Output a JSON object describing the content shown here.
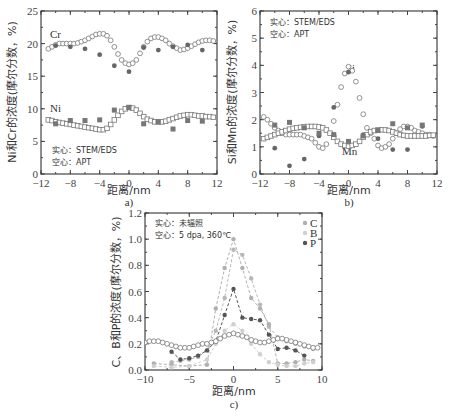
{
  "chart_data": [
    {
      "id": "a",
      "type": "scatter",
      "caption": "a)",
      "xlabel": "距离/nm",
      "ylabel": "Ni和Cr的浓度(摩尔分数，%)",
      "xlim": [
        -12,
        12
      ],
      "ylim": [
        0,
        25
      ],
      "xticks": [
        -12,
        -8,
        -4,
        0,
        4,
        8,
        12
      ],
      "yticks": [
        0,
        5,
        10,
        15,
        20,
        25
      ],
      "annotations": [
        "实心：STEM/EDS",
        "空心：APT"
      ],
      "series_labels": [
        "Cr",
        "Ni"
      ],
      "series": [
        {
          "name": "Cr APT (hollow circle)",
          "marker": "open-circle",
          "x": [
            -11,
            -10.5,
            -10,
            -9.5,
            -9,
            -8.5,
            -8,
            -7.5,
            -7,
            -6.5,
            -6,
            -5.5,
            -5,
            -4.5,
            -4,
            -3.5,
            -3,
            -2.5,
            -2,
            -1.5,
            -1,
            -0.5,
            0,
            0.5,
            1,
            1.5,
            2,
            2.5,
            3,
            3.5,
            4,
            4.5,
            5,
            5.5,
            6,
            6.5,
            7,
            7.5,
            8,
            8.5,
            9,
            9.5,
            10,
            10.5,
            11,
            11.5
          ],
          "y": [
            19.2,
            19.5,
            19.8,
            20.0,
            20.0,
            20.0,
            20.0,
            20.0,
            20.1,
            20.3,
            20.5,
            20.8,
            21.1,
            21.4,
            21.5,
            21.5,
            21.2,
            20.5,
            19.5,
            18.4,
            17.5,
            17.0,
            16.8,
            17.0,
            17.5,
            18.5,
            19.5,
            20.3,
            20.8,
            21.0,
            21.0,
            20.8,
            20.5,
            20.0,
            19.6,
            19.3,
            19.0,
            19.1,
            19.3,
            19.6,
            19.9,
            20.2,
            20.4,
            20.5,
            20.5,
            20.4
          ]
        },
        {
          "name": "Cr STEM/EDS (solid circle)",
          "marker": "filled-circle",
          "x": [
            -10,
            -8,
            -6,
            -4,
            -2,
            0,
            2,
            4,
            6,
            8,
            10
          ],
          "y": [
            19.7,
            19.5,
            19.2,
            18.3,
            16.6,
            15.7,
            19.4,
            19.0,
            19.5,
            19.8,
            19.0
          ]
        },
        {
          "name": "Ni APT (hollow square)",
          "marker": "open-square",
          "x": [
            -11,
            -10.5,
            -10,
            -9.5,
            -9,
            -8.5,
            -8,
            -7.5,
            -7,
            -6.5,
            -6,
            -5.5,
            -5,
            -4.5,
            -4,
            -3.5,
            -3,
            -2.5,
            -2,
            -1.5,
            -1,
            -0.5,
            0,
            0.5,
            1,
            1.5,
            2,
            2.5,
            3,
            3.5,
            4,
            4.5,
            5,
            5.5,
            6,
            6.5,
            7,
            7.5,
            8,
            8.5,
            9,
            9.5,
            10,
            10.5,
            11,
            11.5
          ],
          "y": [
            8.3,
            8.2,
            8.0,
            7.9,
            7.8,
            7.7,
            7.6,
            7.5,
            7.4,
            7.3,
            7.2,
            7.1,
            7.0,
            6.9,
            6.8,
            6.8,
            7.0,
            7.6,
            8.3,
            9.0,
            9.6,
            10.0,
            10.2,
            10.1,
            9.8,
            9.3,
            8.8,
            8.4,
            8.2,
            8.0,
            8.0,
            8.0,
            8.1,
            8.3,
            8.5,
            8.7,
            8.9,
            9.0,
            9.1,
            9.1,
            9.0,
            8.9,
            8.9,
            8.8,
            8.8,
            8.7
          ]
        },
        {
          "name": "Ni STEM/EDS (solid square)",
          "marker": "filled-square",
          "x": [
            -10,
            -8,
            -6,
            -4,
            -2,
            0,
            2,
            4,
            6,
            8,
            10
          ],
          "y": [
            7.7,
            8.2,
            8.2,
            8.3,
            9.8,
            10.2,
            7.7,
            8.0,
            6.9,
            8.2,
            8.1
          ]
        }
      ]
    },
    {
      "id": "b",
      "type": "scatter",
      "caption": "b)",
      "xlabel": "距离/nm",
      "ylabel": "Si和Mn的浓度(摩尔分数，%)",
      "xlim": [
        -12,
        12
      ],
      "ylim": [
        0,
        6
      ],
      "xticks": [
        -12,
        -8,
        -4,
        0,
        4,
        8,
        12
      ],
      "yticks": [
        0,
        1,
        2,
        3,
        4,
        5,
        6
      ],
      "annotations": [
        "实心：STEM/EDS",
        "空心：APT"
      ],
      "series_labels": [
        "Si",
        "Mn"
      ],
      "series": [
        {
          "name": "Si APT (hollow circle)",
          "marker": "open-circle",
          "x": [
            -11.5,
            -11,
            -10.5,
            -10,
            -9.5,
            -9,
            -8.5,
            -8,
            -7.5,
            -7,
            -6.5,
            -6,
            -5.5,
            -5,
            -4.5,
            -4,
            -3.5,
            -3,
            -2,
            -1.5,
            -1,
            -0.5,
            0,
            0.5,
            1,
            1.5,
            2,
            2.5,
            3,
            3.5,
            4,
            4.5,
            5,
            5.5,
            6,
            6.5,
            7,
            7.5,
            8,
            8.5,
            9,
            9.5,
            10,
            10.5,
            11,
            11.5
          ],
          "y": [
            2.1,
            2.0,
            1.85,
            1.7,
            1.6,
            1.5,
            1.45,
            1.45,
            1.45,
            1.45,
            1.45,
            1.4,
            1.35,
            1.3,
            1.15,
            1.0,
            0.95,
            1.1,
            1.95,
            2.55,
            3.2,
            3.7,
            3.95,
            3.8,
            3.4,
            2.8,
            2.2,
            1.7,
            1.5,
            1.3,
            1.05,
            0.95,
            1.0,
            1.1,
            1.3,
            1.5,
            1.65,
            1.75,
            1.75,
            1.7,
            1.6,
            1.55,
            1.5,
            1.45,
            1.45,
            1.4
          ]
        },
        {
          "name": "Si STEM/EDS (solid circle)",
          "marker": "filled-circle",
          "x": [
            -10,
            -8,
            -6,
            -4,
            -2,
            0,
            2,
            4,
            6,
            8,
            10
          ],
          "y": [
            0.95,
            0.3,
            0.55,
            1.4,
            2.45,
            3.75,
            1.45,
            1.3,
            0.9,
            0.9,
            1.75
          ]
        },
        {
          "name": "Mn APT (hollow square)",
          "marker": "open-square",
          "x": [
            -11.5,
            -11,
            -10.5,
            -10,
            -9.5,
            -9,
            -8.5,
            -8,
            -7.5,
            -7,
            -6.5,
            -6,
            -5.5,
            -5,
            -4.5,
            -4,
            -3.5,
            -3,
            -2.5,
            -2,
            -1.5,
            -1,
            -0.5,
            0,
            0.5,
            1,
            1.5,
            2,
            2.5,
            3,
            3.5,
            4,
            4.5,
            5,
            5.5,
            6,
            6.5,
            7,
            7.5,
            8,
            8.5,
            9,
            9.5,
            10,
            10.5,
            11,
            11.5
          ],
          "y": [
            1.3,
            1.35,
            1.4,
            1.45,
            1.5,
            1.55,
            1.6,
            1.65,
            1.68,
            1.7,
            1.72,
            1.74,
            1.75,
            1.75,
            1.75,
            1.73,
            1.7,
            1.62,
            1.5,
            1.35,
            1.2,
            1.1,
            1.05,
            1.02,
            1.05,
            1.1,
            1.2,
            1.35,
            1.45,
            1.55,
            1.6,
            1.62,
            1.63,
            1.62,
            1.6,
            1.55,
            1.5,
            1.45,
            1.42,
            1.4,
            1.4,
            1.4,
            1.4,
            1.4,
            1.4,
            1.42,
            1.43
          ]
        },
        {
          "name": "Mn STEM/EDS (solid square)",
          "marker": "filled-square",
          "x": [
            -10,
            -8,
            -6,
            -4,
            -2,
            0,
            2,
            4,
            6,
            8,
            10
          ],
          "y": [
            1.8,
            1.9,
            1.7,
            1.5,
            1.45,
            1.2,
            1.4,
            1.6,
            1.85,
            1.7,
            1.8
          ]
        }
      ]
    },
    {
      "id": "c",
      "type": "line",
      "caption": "c)",
      "xlabel": "距离/nm",
      "ylabel": "C、B和P的浓度(摩尔分数，%)",
      "xlim": [
        -10,
        10
      ],
      "ylim": [
        0,
        1.2
      ],
      "xticks": [
        -10,
        -5,
        0,
        5,
        10
      ],
      "yticks": [
        0.0,
        0.2,
        0.4,
        0.6,
        0.8,
        1.0,
        1.2
      ],
      "annotations": [
        "实心：未辐照",
        "空心：5 dpa, 360℃"
      ],
      "legend": [
        "C",
        "B",
        "P"
      ],
      "series": [
        {
          "name": "C irradiated (dashed, light gray)",
          "color": "#b8b8b8",
          "x": [
            -7,
            -6,
            -5,
            -4,
            -3,
            -2,
            -1,
            0,
            1,
            2,
            3,
            4,
            5,
            6,
            7,
            8,
            9
          ],
          "y": [
            0.06,
            0.07,
            0.08,
            0.1,
            0.15,
            0.3,
            0.55,
            0.92,
            0.88,
            0.7,
            0.5,
            0.33,
            0.25,
            0.22,
            0.2,
            0.18,
            0.16
          ]
        },
        {
          "name": "C unirradiated (filled)",
          "color": "#b0b0b0",
          "x": [
            -9,
            -7,
            -5,
            -3,
            -2,
            -1,
            0,
            1,
            2,
            3,
            4,
            5,
            6,
            7,
            8,
            9
          ],
          "y": [
            0.05,
            0.04,
            0.03,
            0.04,
            0.47,
            0.78,
            1.0,
            0.78,
            0.55,
            0.47,
            0.35,
            0.05,
            0.05,
            0.06,
            0.08,
            0.07
          ]
        },
        {
          "name": "B irradiated (dashed, lighter gray)",
          "color": "#d0d0d0",
          "x": [
            -9,
            -7,
            -5,
            -3,
            -2,
            -1,
            0,
            1,
            2,
            3,
            4,
            5,
            6,
            7,
            8,
            9
          ],
          "y": [
            0.03,
            0.02,
            0.03,
            0.08,
            0.2,
            0.3,
            0.35,
            0.3,
            0.2,
            0.12,
            0.06,
            0.04,
            0.03,
            0.03,
            0.05,
            0.06
          ]
        },
        {
          "name": "P unirradiated (dashed, dark)",
          "color": "#555555",
          "x": [
            -7,
            -6,
            -5,
            -4,
            -3,
            -2,
            -1,
            0,
            1,
            2,
            3,
            4,
            5,
            6,
            7,
            8
          ],
          "y": [
            0.14,
            0.08,
            0.09,
            0.11,
            0.15,
            0.22,
            0.42,
            0.62,
            0.4,
            0.39,
            0.38,
            0.27,
            0.16,
            0.17,
            0.15,
            0.11
          ]
        },
        {
          "name": "P irradiated APT (hollow circle)",
          "color": "#555555",
          "marker": "open-circle",
          "x": [
            -10,
            -9.5,
            -9,
            -8.5,
            -8,
            -7.5,
            -7,
            -6.5,
            -6,
            -5.5,
            -5,
            -4.5,
            -4,
            -3.5,
            -3,
            -2.5,
            -2,
            -1.5,
            -1,
            -0.5,
            0,
            0.5,
            1,
            1.5,
            2,
            2.5,
            3,
            3.5,
            4,
            4.5,
            5,
            5.5,
            6,
            6.5,
            7,
            7.5,
            8,
            8.5,
            9,
            9.5
          ],
          "y": [
            0.21,
            0.22,
            0.22,
            0.22,
            0.21,
            0.2,
            0.19,
            0.18,
            0.17,
            0.17,
            0.17,
            0.18,
            0.19,
            0.2,
            0.2,
            0.21,
            0.22,
            0.24,
            0.26,
            0.27,
            0.28,
            0.27,
            0.26,
            0.25,
            0.23,
            0.22,
            0.21,
            0.21,
            0.22,
            0.23,
            0.24,
            0.24,
            0.23,
            0.22,
            0.21,
            0.2,
            0.19,
            0.18,
            0.17,
            0.17
          ]
        }
      ]
    }
  ]
}
